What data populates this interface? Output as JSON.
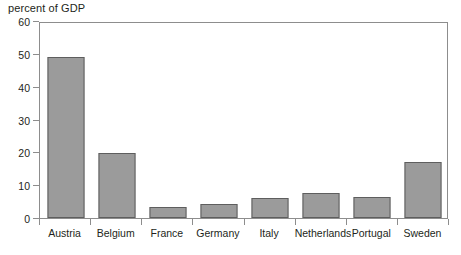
{
  "chart_data": {
    "type": "bar",
    "title": "percent of GDP",
    "xlabel": "",
    "ylabel": "percent of GDP",
    "ylim": [
      0,
      60
    ],
    "yticks": [
      0,
      10,
      20,
      30,
      40,
      50,
      60
    ],
    "grid": false,
    "legend": false,
    "categories": [
      "Austria",
      "Belgium",
      "France",
      "Germany",
      "Italy",
      "Netherlands",
      "Portugal",
      "Sweden"
    ],
    "values": [
      49,
      19.8,
      3.3,
      4.2,
      6.1,
      7.6,
      6.5,
      17
    ],
    "series": [
      {
        "name": "percent of GDP",
        "values": [
          49,
          19.8,
          3.3,
          4.2,
          6.1,
          7.6,
          6.5,
          17
        ]
      }
    ],
    "bar_fill_color": "#9b9b9b",
    "bar_border_color": "#5e5e5e",
    "axis_color": "#8d8d8d",
    "text_color": "#231f20"
  }
}
